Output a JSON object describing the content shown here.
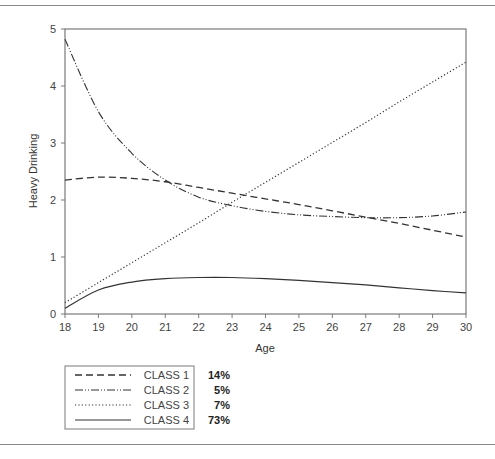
{
  "chart_data": {
    "type": "line",
    "title": "",
    "xlabel": "Age",
    "ylabel": "Heavy Drinking",
    "xlim": [
      18,
      30
    ],
    "ylim": [
      0,
      5
    ],
    "xticks": [
      18,
      19,
      20,
      21,
      22,
      23,
      24,
      25,
      26,
      27,
      28,
      29,
      30
    ],
    "yticks": [
      0,
      1,
      2,
      3,
      4,
      5
    ],
    "grid": false,
    "legend_position": "bottom-left",
    "x": [
      18,
      19,
      20,
      21,
      22,
      23,
      24,
      25,
      26,
      27,
      28,
      29,
      30
    ],
    "series": [
      {
        "name": "CLASS 1",
        "share": "14%",
        "style": "dashed",
        "values": [
          2.35,
          2.4,
          2.38,
          2.32,
          2.22,
          2.12,
          2.02,
          1.92,
          1.81,
          1.7,
          1.59,
          1.47,
          1.35
        ]
      },
      {
        "name": "CLASS 2",
        "share": "5%",
        "style": "dash-dot-dot",
        "values": [
          4.82,
          3.55,
          2.82,
          2.35,
          2.05,
          1.9,
          1.8,
          1.74,
          1.71,
          1.69,
          1.69,
          1.72,
          1.79
        ]
      },
      {
        "name": "CLASS 3",
        "share": "7%",
        "style": "dotted",
        "values": [
          0.2,
          0.55,
          0.9,
          1.25,
          1.6,
          1.96,
          2.31,
          2.66,
          3.01,
          3.36,
          3.72,
          4.07,
          4.42
        ]
      },
      {
        "name": "CLASS 4",
        "share": "73%",
        "style": "solid",
        "values": [
          0.1,
          0.42,
          0.56,
          0.62,
          0.64,
          0.64,
          0.62,
          0.59,
          0.55,
          0.51,
          0.46,
          0.41,
          0.37
        ]
      }
    ]
  }
}
